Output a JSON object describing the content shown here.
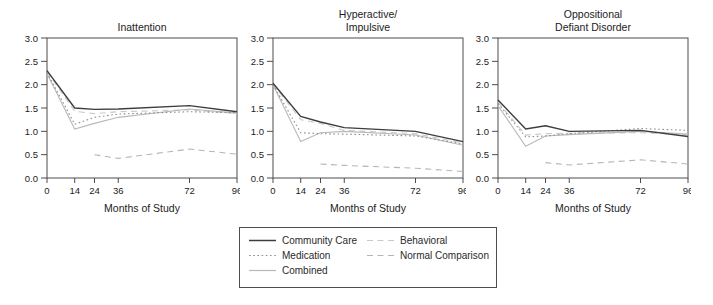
{
  "figure": {
    "xlabel": "Months of Study",
    "background": "#ffffff",
    "axis_color": "#4d4d4d",
    "tick_text_color": "#1c1c1c",
    "title_text_color": "#1c1c1c"
  },
  "chart_data": [
    {
      "type": "line",
      "id": "inattention",
      "title_lines": [
        "Inattention"
      ],
      "xlabel": "Months of Study",
      "xlim": [
        0,
        96
      ],
      "ylim": [
        0,
        3
      ],
      "x_ticks": [
        0,
        14,
        24,
        36,
        72,
        96
      ],
      "y_ticks": [
        3.0,
        2.5,
        2.0,
        1.5,
        1.0,
        0.5,
        0.0
      ],
      "grid": false,
      "series": [
        {
          "name": "Community Care",
          "style": "solid",
          "color": "#3d3d3d",
          "width": 1.4,
          "points": [
            [
              0,
              2.3
            ],
            [
              14,
              1.5
            ],
            [
              24,
              1.47
            ],
            [
              36,
              1.48
            ],
            [
              72,
              1.55
            ],
            [
              96,
              1.42
            ]
          ]
        },
        {
          "name": "Medication",
          "style": "dotted",
          "color": "#8e8e8e",
          "width": 1.1,
          "points": [
            [
              0,
              2.26
            ],
            [
              14,
              1.15
            ],
            [
              24,
              1.3
            ],
            [
              36,
              1.37
            ],
            [
              72,
              1.42
            ],
            [
              96,
              1.4
            ]
          ]
        },
        {
          "name": "Combined",
          "style": "solid",
          "color": "#b7bab7",
          "width": 1.1,
          "points": [
            [
              0,
              2.24
            ],
            [
              14,
              1.05
            ],
            [
              24,
              1.17
            ],
            [
              36,
              1.3
            ],
            [
              72,
              1.48
            ],
            [
              96,
              1.39
            ]
          ]
        },
        {
          "name": "Behavioral",
          "style": "dashed",
          "color": "#c7cac7",
          "width": 1.1,
          "points": [
            [
              0,
              2.28
            ],
            [
              14,
              1.43
            ],
            [
              24,
              1.38
            ],
            [
              36,
              1.42
            ],
            [
              72,
              1.46
            ],
            [
              96,
              1.38
            ]
          ]
        },
        {
          "name": "Normal Comparison",
          "style": "dashed",
          "color": "#b3b6b3",
          "width": 1.1,
          "points": [
            [
              24,
              0.5
            ],
            [
              36,
              0.42
            ],
            [
              72,
              0.62
            ],
            [
              96,
              0.51
            ]
          ]
        }
      ]
    },
    {
      "type": "line",
      "id": "hyperactive-impulsive",
      "title_lines": [
        "Hyperactive/",
        "Impulsive"
      ],
      "xlabel": "Months of Study",
      "xlim": [
        0,
        96
      ],
      "ylim": [
        0,
        3
      ],
      "x_ticks": [
        0,
        14,
        24,
        36,
        72,
        96
      ],
      "y_ticks": [
        3.0,
        2.5,
        2.0,
        1.5,
        1.0,
        0.5,
        0.0
      ],
      "grid": false,
      "series": [
        {
          "name": "Community Care",
          "style": "solid",
          "color": "#3d3d3d",
          "width": 1.4,
          "points": [
            [
              0,
              2.03
            ],
            [
              14,
              1.32
            ],
            [
              24,
              1.2
            ],
            [
              36,
              1.08
            ],
            [
              72,
              1.0
            ],
            [
              96,
              0.78
            ]
          ]
        },
        {
          "name": "Medication",
          "style": "dotted",
          "color": "#8e8e8e",
          "width": 1.1,
          "points": [
            [
              0,
              2.0
            ],
            [
              14,
              0.97
            ],
            [
              24,
              0.95
            ],
            [
              36,
              0.94
            ],
            [
              72,
              0.9
            ],
            [
              96,
              0.73
            ]
          ]
        },
        {
          "name": "Combined",
          "style": "solid",
          "color": "#b7bab7",
          "width": 1.1,
          "points": [
            [
              0,
              2.0
            ],
            [
              14,
              0.78
            ],
            [
              24,
              0.97
            ],
            [
              36,
              1.0
            ],
            [
              72,
              0.92
            ],
            [
              96,
              0.7
            ]
          ]
        },
        {
          "name": "Behavioral",
          "style": "dashed",
          "color": "#c7cac7",
          "width": 1.1,
          "points": [
            [
              0,
              2.01
            ],
            [
              14,
              1.25
            ],
            [
              24,
              1.17
            ],
            [
              36,
              1.02
            ],
            [
              72,
              0.95
            ],
            [
              96,
              0.75
            ]
          ]
        },
        {
          "name": "Normal Comparison",
          "style": "dashed",
          "color": "#b3b6b3",
          "width": 1.1,
          "points": [
            [
              24,
              0.3
            ],
            [
              36,
              0.27
            ],
            [
              72,
              0.21
            ],
            [
              96,
              0.14
            ]
          ]
        }
      ]
    },
    {
      "type": "line",
      "id": "oppositional-defiant-disorder",
      "title_lines": [
        "Oppositional",
        "Defiant Disorder"
      ],
      "xlabel": "Months of Study",
      "xlim": [
        0,
        96
      ],
      "ylim": [
        0,
        3
      ],
      "x_ticks": [
        0,
        14,
        24,
        36,
        72,
        96
      ],
      "y_ticks": [
        3.0,
        2.5,
        2.0,
        1.5,
        1.0,
        0.5,
        0.0
      ],
      "grid": false,
      "series": [
        {
          "name": "Community Care",
          "style": "solid",
          "color": "#3d3d3d",
          "width": 1.4,
          "points": [
            [
              0,
              1.67
            ],
            [
              14,
              1.05
            ],
            [
              24,
              1.12
            ],
            [
              36,
              1.0
            ],
            [
              72,
              1.02
            ],
            [
              96,
              0.89
            ]
          ]
        },
        {
          "name": "Medication",
          "style": "dotted",
          "color": "#8e8e8e",
          "width": 1.1,
          "points": [
            [
              0,
              1.6
            ],
            [
              14,
              0.88
            ],
            [
              24,
              0.9
            ],
            [
              36,
              0.95
            ],
            [
              72,
              1.06
            ],
            [
              96,
              1.02
            ]
          ]
        },
        {
          "name": "Combined",
          "style": "solid",
          "color": "#b7bab7",
          "width": 1.1,
          "points": [
            [
              0,
              1.55
            ],
            [
              14,
              0.68
            ],
            [
              24,
              0.9
            ],
            [
              36,
              0.93
            ],
            [
              72,
              1.0
            ],
            [
              96,
              0.94
            ]
          ]
        },
        {
          "name": "Behavioral",
          "style": "dashed",
          "color": "#c7cac7",
          "width": 1.1,
          "points": [
            [
              0,
              1.62
            ],
            [
              14,
              0.92
            ],
            [
              24,
              0.95
            ],
            [
              36,
              0.96
            ],
            [
              72,
              0.97
            ],
            [
              96,
              0.93
            ]
          ]
        },
        {
          "name": "Normal Comparison",
          "style": "dashed",
          "color": "#b3b6b3",
          "width": 1.1,
          "points": [
            [
              24,
              0.33
            ],
            [
              36,
              0.28
            ],
            [
              72,
              0.39
            ],
            [
              96,
              0.3
            ]
          ]
        }
      ]
    }
  ],
  "legend": {
    "position": "bottom-center",
    "items": [
      {
        "label": "Community Care",
        "style": "solid",
        "color": "#3d3d3d"
      },
      {
        "label": "Medication",
        "style": "dotted",
        "color": "#8e8e8e"
      },
      {
        "label": "Combined",
        "style": "solid",
        "color": "#b7bab7"
      },
      {
        "label": "Behavioral",
        "style": "dashed",
        "color": "#c7cac7"
      },
      {
        "label": "Normal Comparison",
        "style": "dashed",
        "color": "#b3b6b3"
      }
    ],
    "columns": [
      [
        0,
        1,
        2
      ],
      [
        3,
        4
      ]
    ]
  }
}
